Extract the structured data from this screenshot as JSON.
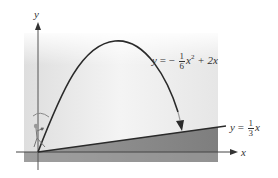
{
  "figure": {
    "axes": {
      "x_label": "x",
      "y_label": "y"
    },
    "curves": {
      "parabola": {
        "label_lhs": "y",
        "label_eq": "=",
        "label_sign": "−",
        "label_frac_num": "1",
        "label_frac_den": "6",
        "label_var": "x",
        "label_exp": "2",
        "label_rest": "+ 2x",
        "full_text": "y = −(1/6)x² + 2x"
      },
      "line": {
        "label_lhs": "y",
        "label_eq": "=",
        "label_frac_num": "1",
        "label_frac_den": "3",
        "label_var": "x",
        "full_text": "y = (1/3)x"
      }
    },
    "illustration": "person-throwing-ball-icon",
    "colors": {
      "curve": "#2a2a2a",
      "axis": "#444444",
      "panel_light": "#e9e9e9",
      "ground_shade": "#8c8c8c",
      "text": "#333333"
    }
  }
}
